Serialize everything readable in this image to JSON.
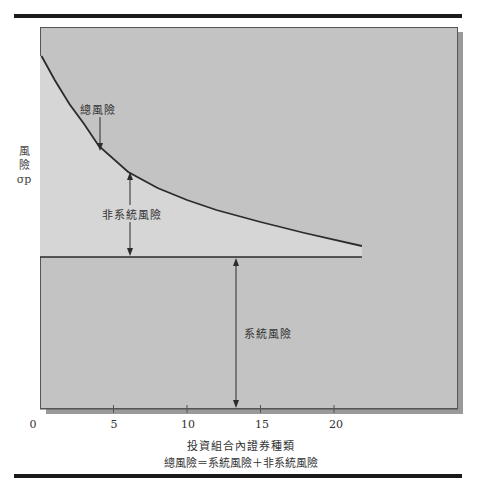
{
  "chart_data": {
    "type": "line",
    "title": "",
    "xlabel": "投資組合內證券種類",
    "ylabel": "風險 σp",
    "ylabel_lines": [
      "風",
      "險",
      "σp"
    ],
    "formula": "總風險＝系統風險＋非系統風險",
    "x_ticks": [
      "0",
      "5",
      "10",
      "15",
      "20"
    ],
    "xlim": [
      0,
      22
    ],
    "grid": false,
    "legend": "none",
    "series": [
      {
        "name": "總風險",
        "x": [
          0.1,
          1,
          2,
          3,
          4,
          6,
          8,
          10,
          12,
          15,
          18,
          21.9
        ],
        "y_px": [
          56,
          80,
          104,
          124,
          146,
          172,
          188,
          200,
          210,
          222,
          233,
          246
        ]
      },
      {
        "name": "系統風險",
        "x": [
          0,
          21.9
        ],
        "y_px": [
          257,
          257
        ]
      }
    ],
    "annotations": [
      {
        "text": "總風險",
        "x": 4,
        "arrow": "down to curve"
      },
      {
        "text": "非系統風險",
        "x": 6,
        "arrow": "double: curve to systematic line"
      },
      {
        "text": "系統風險",
        "x": 13.5,
        "arrow": "double: systematic line to x-axis"
      }
    ],
    "colors": {
      "panel": "#c3c3c3",
      "unsystematic_area": "#d6d6d6",
      "line": "#2b2b2b",
      "shadow": "#9a9a9a"
    }
  }
}
